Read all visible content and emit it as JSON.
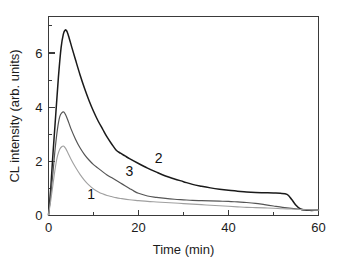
{
  "chart_data": {
    "type": "line",
    "title": "",
    "xlabel": "Time (min)",
    "ylabel": "CL intensity (arb. units)",
    "xlim": [
      0,
      60
    ],
    "ylim": [
      0,
      7.35
    ],
    "xticks": [
      0,
      20,
      40,
      60
    ],
    "xticklabels": [
      "0",
      "20",
      "40",
      "60"
    ],
    "xminorticks": [
      10,
      30,
      50
    ],
    "yticks": [
      0,
      2,
      4,
      6
    ],
    "yticklabels": [
      "0",
      "2",
      "4",
      "6"
    ],
    "yminorticks": [
      1,
      3,
      5,
      7
    ],
    "grid": false,
    "legend_position": "inline-curve-labels",
    "series": [
      {
        "name": "2",
        "label": "2",
        "color": "#1a1a1a",
        "width": 1.5,
        "label_x": 24.5,
        "label_y": 1.95,
        "x": [
          0,
          0.5,
          1,
          1.6,
          2.2,
          2.8,
          3.3,
          3.7,
          4.1,
          4.6,
          5.2,
          6,
          7,
          8,
          9,
          10,
          11,
          12,
          13,
          14,
          15,
          16,
          17,
          18,
          20,
          22,
          24,
          26,
          28,
          30,
          32,
          34,
          36,
          38,
          40,
          42,
          44,
          46,
          48,
          50,
          51.5,
          53,
          54,
          55,
          56,
          57,
          58,
          59,
          60
        ],
        "y": [
          0.02,
          1.0,
          2.3,
          3.7,
          5.1,
          6.2,
          6.7,
          6.85,
          6.8,
          6.55,
          6.2,
          5.75,
          5.2,
          4.7,
          4.25,
          3.85,
          3.5,
          3.2,
          2.9,
          2.65,
          2.42,
          2.3,
          2.2,
          2.1,
          1.92,
          1.75,
          1.6,
          1.46,
          1.35,
          1.25,
          1.15,
          1.08,
          1.02,
          0.97,
          0.93,
          0.9,
          0.87,
          0.85,
          0.84,
          0.83,
          0.82,
          0.78,
          0.6,
          0.38,
          0.24,
          0.2,
          0.19,
          0.19,
          0.2
        ]
      },
      {
        "name": "3",
        "label": "3",
        "color": "#555555",
        "width": 1.2,
        "label_x": 18.0,
        "label_y": 1.45,
        "x": [
          0,
          0.5,
          1,
          1.5,
          2,
          2.5,
          3,
          3.4,
          3.8,
          4.3,
          5,
          6,
          7,
          8,
          9,
          10,
          11,
          12,
          13,
          14,
          15,
          16,
          17,
          18,
          19,
          20,
          22,
          24,
          26,
          28,
          30,
          32,
          34,
          36,
          38,
          40,
          42,
          44,
          46,
          48,
          50,
          52,
          54,
          56,
          58,
          60
        ],
        "y": [
          0.02,
          0.75,
          1.6,
          2.5,
          3.2,
          3.65,
          3.8,
          3.82,
          3.72,
          3.52,
          3.2,
          2.82,
          2.5,
          2.25,
          2.05,
          1.88,
          1.75,
          1.62,
          1.5,
          1.4,
          1.3,
          1.2,
          1.1,
          1.0,
          0.9,
          0.82,
          0.72,
          0.67,
          0.63,
          0.6,
          0.58,
          0.56,
          0.55,
          0.54,
          0.53,
          0.52,
          0.5,
          0.48,
          0.45,
          0.4,
          0.35,
          0.3,
          0.26,
          0.23,
          0.21,
          0.2
        ]
      },
      {
        "name": "1",
        "label": "1",
        "color": "#a0a0a0",
        "width": 1.1,
        "label_x": 9.5,
        "label_y": 0.62,
        "x": [
          0,
          0.5,
          1,
          1.5,
          2,
          2.5,
          3,
          3.4,
          3.8,
          4.3,
          5,
          6,
          7,
          8,
          9,
          10,
          11,
          12,
          13,
          14,
          15,
          16,
          18,
          20,
          22,
          24,
          26,
          28,
          30,
          32,
          34,
          36,
          38,
          40,
          42,
          44,
          46,
          48,
          50,
          52,
          54,
          56,
          58,
          60
        ],
        "y": [
          0.02,
          0.55,
          1.15,
          1.75,
          2.2,
          2.45,
          2.55,
          2.56,
          2.48,
          2.32,
          2.08,
          1.78,
          1.52,
          1.3,
          1.12,
          0.98,
          0.88,
          0.8,
          0.74,
          0.7,
          0.66,
          0.63,
          0.58,
          0.55,
          0.52,
          0.5,
          0.48,
          0.46,
          0.44,
          0.42,
          0.4,
          0.38,
          0.36,
          0.34,
          0.32,
          0.3,
          0.29,
          0.28,
          0.27,
          0.25,
          0.24,
          0.22,
          0.21,
          0.2
        ]
      }
    ]
  }
}
